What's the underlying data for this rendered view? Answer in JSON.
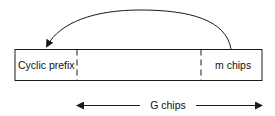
{
  "diagram": {
    "colors": {
      "stroke": "#1a1a1a",
      "background": "#ffffff",
      "text": "#111111"
    },
    "frame": {
      "segments": [
        {
          "id": "cyclic-prefix",
          "label": "Cyclic prefix"
        },
        {
          "id": "middle",
          "label": ""
        },
        {
          "id": "m-chips",
          "label": "m chips"
        }
      ]
    },
    "copy_arrow": {
      "from": "m-chips",
      "to": "cyclic-prefix"
    },
    "span_arrow": {
      "label": "G chips"
    }
  }
}
